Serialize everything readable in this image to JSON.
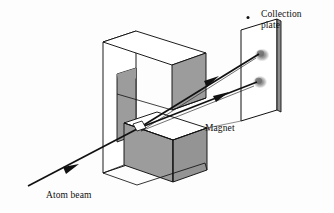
{
  "figure": {
    "background_color": "#fdfdfd",
    "stroke_color": "#111111",
    "face_shade_gray": "#9c9c9c",
    "face_shade_gray_dark": "#8e8e8e",
    "face_white": "#ffffff",
    "spot_color": "#8f8f8f"
  },
  "labels": {
    "collection_plate": "Collection\nplate",
    "magnet": "Magnet",
    "atom_beam": "Atom beam"
  },
  "components": {
    "magnet": {
      "name": "Magnet",
      "description": "C-shaped electromagnet with upper and lower pole pieces separated by a gap",
      "upper_block_top_face_color": "#ffffff",
      "upper_block_front_face_color": "#9c9c9c",
      "lower_block_top_face_color": "#ffffff",
      "lower_block_front_face_color": "#9c9c9c",
      "backplate_face_color": "#ffffff",
      "pole_gap_inner_face_color": "#9c9c9c"
    },
    "collection_plate": {
      "name": "Collection plate",
      "description": "Thin flat plate downstream of the magnet that records the split beams",
      "face_color": "#ffffff",
      "edge_color": "#8e8e8e",
      "spot_count": 2,
      "spots": [
        {
          "label": "upper deflected beam spot"
        },
        {
          "label": "lower deflected beam spot"
        }
      ]
    },
    "atom_beam": {
      "name": "Atom beam",
      "description": "Incoming collimated beam of neutral atoms entering the magnet gap from lower left",
      "splits_into": 2
    }
  },
  "marks": {
    "dot_above_plate": "•"
  }
}
